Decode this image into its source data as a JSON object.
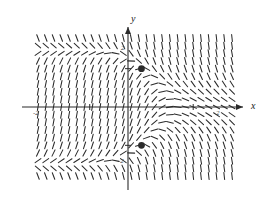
{
  "figure": {
    "kind": "slope-field-plot",
    "background": "#ffffff",
    "ink": "#2b2b2b"
  },
  "axes": {
    "x_label": "x",
    "y_label": "y",
    "x_axis_pixel_y": 107,
    "y_axis_pixel_x": 128,
    "x_arrow": true,
    "y_arrow": true
  },
  "ticks": {
    "y_positive": "2",
    "y_negative": "-2",
    "x_negative": "-2",
    "x_positive": "2"
  },
  "chart_data": {
    "type": "scatter",
    "title": "",
    "xlabel": "x",
    "ylabel": "y",
    "xlim": [
      -4.0,
      3.5
    ],
    "ylim": [
      -3.6,
      3.6
    ],
    "grid": false,
    "legend": null,
    "subtype": "direction-field",
    "slope_field": {
      "x_range": [
        -4.0,
        3.5
      ],
      "y_range": [
        -3.6,
        3.6
      ],
      "x_count": 26,
      "y_count": 19,
      "segment_length_px": 7,
      "slope_rule": "dy/dx proportional to (4 - y^2) * decreasing function of x; positive steep for x < 0, negative steep for x > 0, near zero along y = +/-2"
    },
    "marked_points": [
      {
        "label": "",
        "x": 0,
        "y": 2,
        "style": "filled-circle",
        "radius_px": 3.4
      },
      {
        "label": "",
        "x": 0,
        "y": -2,
        "style": "filled-circle",
        "radius_px": 3.4
      }
    ],
    "x_ticks": [
      -2,
      2
    ],
    "y_ticks": [
      2,
      -2
    ],
    "x_tick_labels": [
      "-2",
      "2"
    ],
    "y_tick_labels": [
      "2",
      "-2"
    ]
  }
}
